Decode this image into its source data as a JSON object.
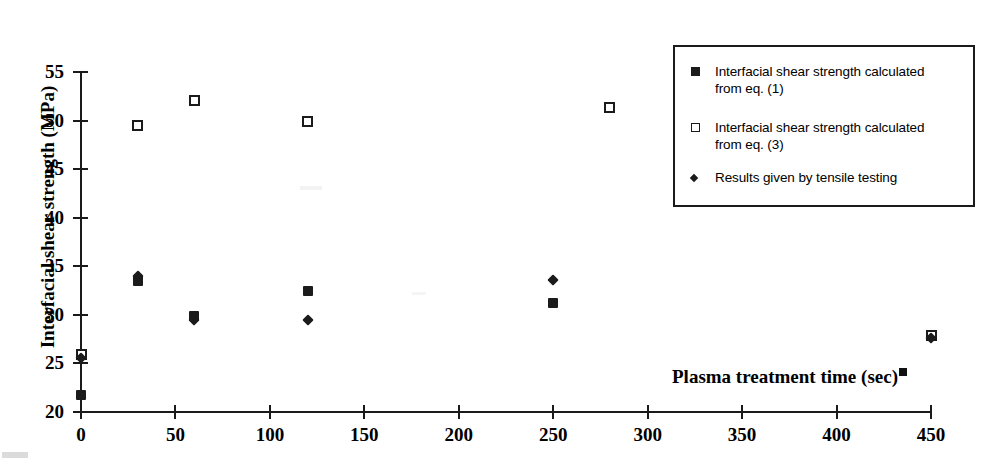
{
  "chart_data": {
    "type": "scatter",
    "title": "",
    "xlabel": "Plasma treatment time (sec)",
    "ylabel": "Interfacial shear strength (MPa)",
    "xlim": [
      0,
      450
    ],
    "ylim": [
      20,
      55
    ],
    "xticks": [
      0,
      50,
      100,
      150,
      200,
      250,
      300,
      350,
      400,
      450
    ],
    "yticks": [
      20,
      25,
      30,
      35,
      40,
      45,
      50,
      55
    ],
    "xtick_labels": [
      "0",
      "50",
      "100",
      "150",
      "200",
      "250",
      "300",
      "350",
      "400",
      "450"
    ],
    "ytick_labels": [
      "20",
      "25",
      "30",
      "35",
      "40",
      "45",
      "50",
      "55"
    ],
    "grid": false,
    "legend_position": "top-right",
    "series": [
      {
        "name": "Interfacial shear strength calculated from eq. (1)",
        "marker": "filled-square",
        "x": [
          0,
          30,
          60,
          120,
          250
        ],
        "y": [
          21.7,
          33.5,
          29.9,
          32.5,
          31.2
        ]
      },
      {
        "name": "Interfacial shear strength calculated from eq. (3)",
        "marker": "open-square",
        "x": [
          0,
          30,
          60,
          120,
          280,
          450
        ],
        "y": [
          25.9,
          49.5,
          52.1,
          49.9,
          51.3,
          27.9
        ]
      },
      {
        "name": "Results given by tensile testing",
        "marker": "diamond",
        "x": [
          0,
          30,
          60,
          120,
          250,
          450
        ],
        "y": [
          25.6,
          34.0,
          29.5,
          29.5,
          33.6,
          27.6
        ]
      }
    ]
  },
  "legend": {
    "entries": [
      {
        "marker": "filled-square",
        "label": "Interfacial shear strength calculated\nfrom eq. (1)"
      },
      {
        "marker": "open-square",
        "label": "Interfacial shear strength calculated\nfrom eq. (3)"
      },
      {
        "marker": "diamond",
        "label": "Results given by tensile testing"
      }
    ]
  },
  "colors": {
    "ink": "#1b1b1b",
    "page": "#ffffff"
  }
}
